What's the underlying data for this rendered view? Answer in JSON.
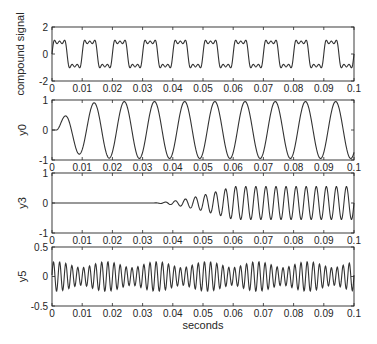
{
  "chart_data": [
    {
      "type": "line",
      "ylabel": "compound signal",
      "xlabel": "",
      "xlim": [
        0,
        0.1
      ],
      "ylim": [
        -2,
        2
      ],
      "xticks": [
        "0",
        "0.01",
        "0.02",
        "0.03",
        "0.04",
        "0.05",
        "0.06",
        "0.07",
        "0.08",
        "0.09",
        "0.1"
      ],
      "yticks": [
        "-2",
        "0",
        "2"
      ],
      "grid": false,
      "series": [
        {
          "name": "compound signal",
          "description": "100 Hz square-like wave from 1st+3rd+5th harmonics",
          "fundamental_hz": 100,
          "amplitude_range": [
            -1.15,
            1.15
          ]
        }
      ],
      "frame": {
        "top": 27,
        "bottom": 81
      }
    },
    {
      "type": "line",
      "ylabel": "y0",
      "xlabel": "",
      "xlim": [
        0,
        0.1
      ],
      "ylim": [
        -1,
        1
      ],
      "xticks": [
        "0",
        "0.01",
        "0.02",
        "0.03",
        "0.04",
        "0.05",
        "0.06",
        "0.07",
        "0.08",
        "0.09",
        "0.1"
      ],
      "yticks": [
        "-1",
        "0",
        "1"
      ],
      "grid": false,
      "series": [
        {
          "name": "y0",
          "description": "filtered 100 Hz fundamental, transient start, steady amplitude ~0.95",
          "freq_hz": 100,
          "amplitude": 0.95
        }
      ],
      "frame": {
        "top": 100,
        "bottom": 160
      }
    },
    {
      "type": "line",
      "ylabel": "y3",
      "xlabel": "",
      "xlim": [
        0,
        0.1
      ],
      "ylim": [
        -1,
        1
      ],
      "xticks": [
        "0",
        "0.01",
        "0.02",
        "0.03",
        "0.04",
        "0.05",
        "0.06",
        "0.07",
        "0.08",
        "0.09",
        "0.1"
      ],
      "yticks": [
        "-1",
        "0",
        "1"
      ],
      "grid": false,
      "series": [
        {
          "name": "y3",
          "description": "300 Hz component, zero until ~0.033 s, grows to amplitude ~0.55 by ~0.06 s",
          "freq_hz": 300,
          "onset_s": 0.033,
          "amplitude": 0.55
        }
      ],
      "frame": {
        "top": 173,
        "bottom": 233
      }
    },
    {
      "type": "line",
      "ylabel": "y5",
      "xlabel": "seconds",
      "xlim": [
        0,
        0.1
      ],
      "ylim": [
        -0.5,
        0.5
      ],
      "xticks": [
        "0",
        "0.01",
        "0.02",
        "0.03",
        "0.04",
        "0.05",
        "0.06",
        "0.07",
        "0.08",
        "0.09",
        "0.1"
      ],
      "yticks": [
        "-0.5",
        "0",
        "0.5"
      ],
      "grid": false,
      "series": [
        {
          "name": "y5",
          "description": "~500 Hz oscillation, amplitude ~0.22 with slight beating",
          "freq_hz": 500,
          "amplitude": 0.22
        }
      ],
      "frame": {
        "top": 247,
        "bottom": 306
      }
    }
  ],
  "layout": {
    "left": 52,
    "right": 354
  },
  "xlabel": "seconds",
  "line_color": "#333333"
}
